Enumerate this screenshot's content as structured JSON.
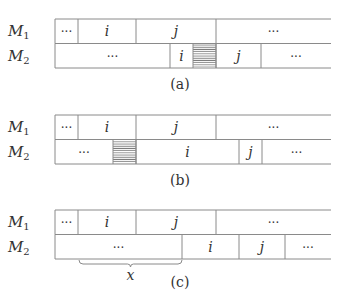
{
  "panels": [
    {
      "id": "a",
      "caption": "(a)",
      "top": 19,
      "rows": [
        {
          "label": "M",
          "subscript": "1",
          "cells": [
            {
              "x0": 55,
              "x1": 78,
              "text": "···",
              "italic": false
            },
            {
              "x0": 78,
              "x1": 136,
              "text": "i",
              "italic": true
            },
            {
              "x0": 136,
              "x1": 216,
              "text": "j",
              "italic": true
            },
            {
              "x0": 216,
              "x1": 331,
              "text": "···",
              "italic": false,
              "open": true
            }
          ]
        },
        {
          "label": "M",
          "subscript": "2",
          "cells": [
            {
              "x0": 55,
              "x1": 170,
              "text": "···",
              "italic": false
            },
            {
              "x0": 170,
              "x1": 193,
              "text": "i",
              "italic": true
            },
            {
              "x0": 193,
              "x1": 216,
              "text": "",
              "hatched": true
            },
            {
              "x0": 216,
              "x1": 261,
              "text": "j",
              "italic": true
            },
            {
              "x0": 261,
              "x1": 331,
              "text": "···",
              "italic": false,
              "open": true
            }
          ]
        }
      ]
    },
    {
      "id": "b",
      "caption": "(b)",
      "top": 115,
      "rows": [
        {
          "label": "M",
          "subscript": "1",
          "cells": [
            {
              "x0": 55,
              "x1": 78,
              "text": "···",
              "italic": false
            },
            {
              "x0": 78,
              "x1": 136,
              "text": "i",
              "italic": true
            },
            {
              "x0": 136,
              "x1": 216,
              "text": "j",
              "italic": true
            },
            {
              "x0": 216,
              "x1": 331,
              "text": "···",
              "italic": false,
              "open": true
            }
          ]
        },
        {
          "label": "M",
          "subscript": "2",
          "cells": [
            {
              "x0": 55,
              "x1": 113,
              "text": "···",
              "italic": false
            },
            {
              "x0": 113,
              "x1": 136,
              "text": "",
              "hatched": true
            },
            {
              "x0": 136,
              "x1": 239,
              "text": "i",
              "italic": true
            },
            {
              "x0": 239,
              "x1": 262,
              "text": "j",
              "italic": true
            },
            {
              "x0": 262,
              "x1": 331,
              "text": "···",
              "italic": false,
              "open": true
            }
          ]
        }
      ]
    },
    {
      "id": "c",
      "caption": "(c)",
      "top": 210,
      "rows": [
        {
          "label": "M",
          "subscript": "1",
          "cells": [
            {
              "x0": 55,
              "x1": 78,
              "text": "···",
              "italic": false
            },
            {
              "x0": 78,
              "x1": 136,
              "text": "i",
              "italic": true
            },
            {
              "x0": 136,
              "x1": 216,
              "text": "j",
              "italic": true
            },
            {
              "x0": 216,
              "x1": 331,
              "text": "···",
              "italic": false,
              "open": true
            }
          ]
        },
        {
          "label": "M",
          "subscript": "2",
          "cells": [
            {
              "x0": 55,
              "x1": 182,
              "text": "···",
              "italic": false
            },
            {
              "x0": 182,
              "x1": 239,
              "text": "i",
              "italic": true
            },
            {
              "x0": 239,
              "x1": 285,
              "text": "j",
              "italic": true
            },
            {
              "x0": 285,
              "x1": 331,
              "text": "···",
              "italic": false,
              "open": true
            }
          ]
        }
      ],
      "brace": {
        "x0": 79,
        "x1": 182,
        "label": "x"
      }
    }
  ],
  "layout": {
    "row_height": 24.5,
    "caption_offset": 70,
    "line_color": "#8a8a8a",
    "text_color": "#333333"
  }
}
